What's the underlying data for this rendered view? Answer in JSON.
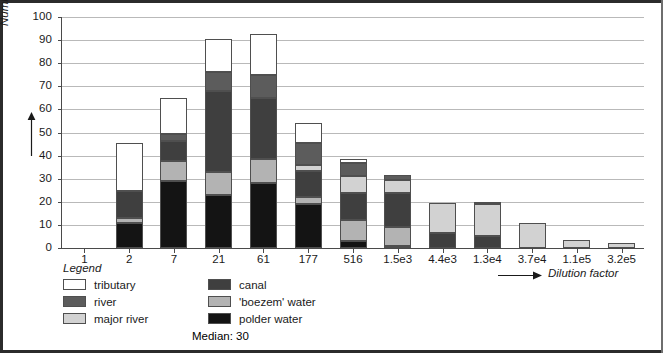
{
  "chart_data": {
    "type": "bar",
    "subtype": "stacked-bar",
    "title": "",
    "xlabel": "Dilution factor",
    "ylabel": "Number of cases",
    "ylim": [
      0,
      100
    ],
    "ytick_step": 10,
    "yticks": [
      0,
      10,
      20,
      30,
      40,
      50,
      60,
      70,
      80,
      90,
      100
    ],
    "grid": "horizontal",
    "categories": [
      "1",
      "2",
      "7",
      "21",
      "61",
      "177",
      "516",
      "1.5e3",
      "4.4e3",
      "1.3e4",
      "3.7e4",
      "1.1e5",
      "3.2e5"
    ],
    "stack_order_bottom_to_top": [
      "polder water",
      "'boezem' water",
      "canal",
      "major river",
      "river",
      "tributary"
    ],
    "series": [
      {
        "name": "polder water",
        "color": "#141414",
        "values": [
          0,
          11,
          29,
          23,
          28,
          19,
          3,
          1,
          0,
          0,
          0,
          0,
          0
        ]
      },
      {
        "name": "'boezem' water",
        "color": "#b3b3b3",
        "values": [
          0,
          2,
          8.5,
          10,
          10.5,
          3,
          9,
          8,
          0,
          0,
          0,
          0,
          0
        ]
      },
      {
        "name": "canal",
        "color": "#3f3f3f",
        "values": [
          0,
          11.5,
          9,
          35,
          26.5,
          11.5,
          12,
          15,
          6.5,
          5,
          0,
          0,
          0
        ]
      },
      {
        "name": "major river",
        "color": "#d2d2d2",
        "values": [
          0,
          0,
          0,
          0,
          0,
          2.5,
          7,
          5.5,
          13,
          14,
          11,
          3.5,
          2
        ]
      },
      {
        "name": "river",
        "color": "#5c5c5c",
        "values": [
          0,
          0,
          3,
          8,
          10,
          9.5,
          6,
          2,
          0,
          0.5,
          0,
          0,
          0
        ]
      },
      {
        "name": "tributary",
        "color": "#ffffff",
        "values": [
          0,
          21,
          15.5,
          14.5,
          17.5,
          8.5,
          1.5,
          0,
          0,
          0,
          0,
          0,
          0
        ]
      }
    ],
    "totals": [
      0,
      45.5,
      65,
      90.5,
      92.5,
      54,
      38.5,
      31.5,
      19.5,
      19.5,
      11,
      3.5,
      2
    ],
    "annotation": "Median: 30"
  },
  "axes": {
    "y_title": "Number of cases",
    "x_title": "Dilution factor",
    "y_tick_labels": [
      "100",
      "90",
      "80",
      "70",
      "60",
      "50",
      "40",
      "30",
      "20",
      "10",
      "0"
    ],
    "x_tick_labels": [
      "1",
      "2",
      "7",
      "21",
      "61",
      "177",
      "516",
      "1.5e3",
      "4.4e3",
      "1.3e4",
      "3.7e4",
      "1.1e5",
      "3.2e5"
    ]
  },
  "legend": {
    "title": "Legend",
    "column_left": [
      {
        "label": "tributary",
        "color": "#ffffff"
      },
      {
        "label": "river",
        "color": "#5c5c5c"
      },
      {
        "label": "major river",
        "color": "#d2d2d2"
      }
    ],
    "column_right": [
      {
        "label": "canal",
        "color": "#3f3f3f"
      },
      {
        "label": "'boezem' water",
        "color": "#b3b3b3"
      },
      {
        "label": "polder water",
        "color": "#141414"
      }
    ],
    "median_note": "Median: 30"
  },
  "colors": {
    "tributary": "#ffffff",
    "river": "#5c5c5c",
    "major_river": "#d2d2d2",
    "canal": "#3f3f3f",
    "boezem_water": "#b3b3b3",
    "polder_water": "#141414",
    "gridline": "#b9b9b9",
    "axis": "#4a4a4a",
    "frame": "#2b2b2b",
    "text": "#1a1a1a"
  }
}
